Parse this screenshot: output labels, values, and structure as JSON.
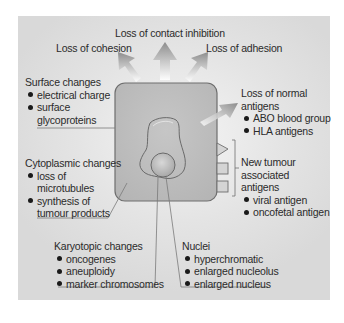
{
  "diagram": {
    "top_labels": {
      "contact_inhibition": "Loss of contact inhibition",
      "cohesion": "Loss of cohesion",
      "adhesion": "Loss of adhesion"
    },
    "surface": {
      "heading": "Surface changes",
      "items": [
        "electrical charge",
        "surface",
        "glycoproteins"
      ]
    },
    "normal_antigens": {
      "heading_line1": "Loss of normal",
      "heading_line2": "antigens",
      "items": [
        "ABO blood group",
        "HLA antigens"
      ]
    },
    "cytoplasmic": {
      "heading": "Cytoplasmic changes",
      "items": [
        "loss of",
        "microtubules",
        "synthesis of",
        "tumour products"
      ]
    },
    "new_antigens": {
      "heading_line1": "New tumour",
      "heading_line2": "associated",
      "heading_line3": "antigens",
      "items": [
        "viral antigen",
        "oncofetal antigen"
      ]
    },
    "karyotopic": {
      "heading": "Karyotopic changes",
      "items": [
        "oncogenes",
        "aneuploidy",
        "marker chromosomes"
      ]
    },
    "nuclei": {
      "heading": "Nuclei",
      "items": [
        "hyperchromatic",
        "enlarged nucleolus",
        "enlarged nucleus"
      ]
    },
    "colors": {
      "panel": "#dcdcdc",
      "cell_fill": "#bdbdbd",
      "cell_stroke": "#6e6e6e",
      "arrow": "#9a9a9a",
      "text": "#2b2b2b"
    }
  }
}
